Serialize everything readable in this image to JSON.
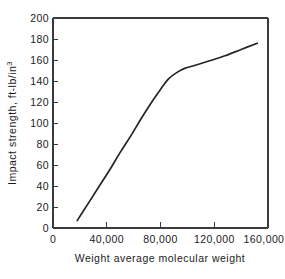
{
  "chart_data": {
    "type": "line",
    "title": "",
    "xlabel": "Weight average molecular weight",
    "ylabel": "Impact strength, ft-lb/in",
    "ylabel_superscript": "3",
    "ylabel_full": "Impact strength, ft-lb/in³",
    "xlim": [
      0,
      160000
    ],
    "ylim": [
      0,
      200
    ],
    "grid": false,
    "legend": null,
    "x_ticks": [
      0,
      40000,
      80000,
      120000,
      160000
    ],
    "x_tick_labels": [
      "0",
      "40,000",
      "80,000",
      "120,000",
      "160,000"
    ],
    "x_minor_ticks": [
      20000,
      60000,
      100000,
      140000
    ],
    "y_ticks": [
      0,
      20,
      40,
      60,
      80,
      100,
      120,
      140,
      160,
      180,
      200
    ],
    "y_tick_labels": [
      "0",
      "20",
      "40",
      "60",
      "80",
      "100",
      "120",
      "140",
      "160",
      "180",
      "200"
    ],
    "series": [
      {
        "name": "impact strength",
        "color": "#252525",
        "x": [
          18000,
          26000,
          34000,
          42000,
          50000,
          58000,
          66000,
          74000,
          80000,
          86000,
          92000,
          98000,
          106000,
          116000,
          128000,
          140000,
          152000
        ],
        "values": [
          7,
          23,
          39,
          55,
          72,
          88,
          105,
          121,
          132,
          142,
          148,
          152,
          155,
          159,
          164,
          170,
          176
        ]
      }
    ]
  },
  "axes": {
    "left_axis_name": "y-axis",
    "bottom_axis_name": "x-axis",
    "axis_color": "#3a3a3a"
  }
}
